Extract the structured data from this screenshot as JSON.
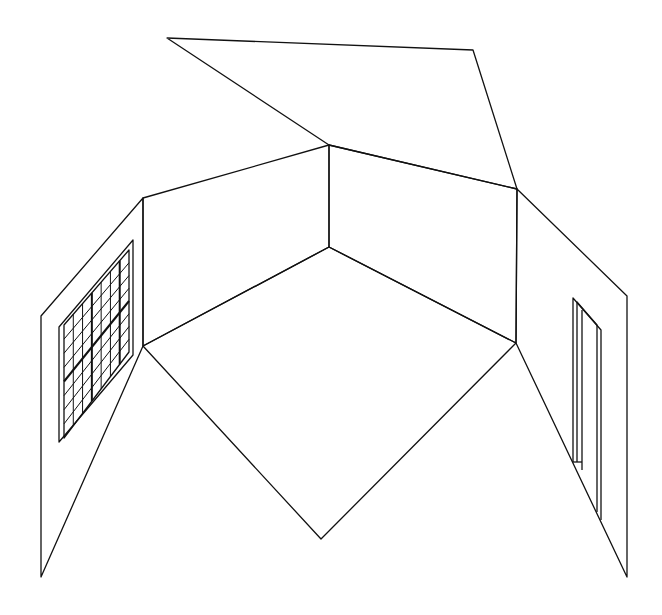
{
  "diagram": {
    "stroke_color": "#111111",
    "background": "#ffffff",
    "ceiling": [
      [
        167,
        38
      ],
      [
        473,
        50
      ],
      [
        517,
        189
      ],
      [
        329,
        145
      ]
    ],
    "back_wall_left": [
      [
        143,
        198
      ],
      [
        329,
        145
      ],
      [
        329,
        247
      ],
      [
        143,
        346
      ]
    ],
    "back_wall_right": [
      [
        329,
        145
      ],
      [
        517,
        189
      ],
      [
        516,
        343
      ],
      [
        329,
        247
      ]
    ],
    "floor": [
      [
        143,
        346
      ],
      [
        329,
        247
      ],
      [
        516,
        343
      ],
      [
        321,
        539
      ]
    ],
    "left_wall": [
      [
        41,
        316
      ],
      [
        143,
        198
      ],
      [
        143,
        346
      ],
      [
        41,
        577
      ]
    ],
    "right_wall": [
      [
        517,
        189
      ],
      [
        627,
        296
      ],
      [
        627,
        577
      ],
      [
        516,
        343
      ]
    ],
    "window": {
      "outer": [
        [
          59,
          327
        ],
        [
          133,
          240
        ],
        [
          133,
          355
        ],
        [
          59,
          442
        ]
      ],
      "inner": [
        [
          64,
          325
        ],
        [
          129,
          250
        ],
        [
          129,
          352
        ],
        [
          64,
          438
        ]
      ],
      "cols": 7,
      "rows": 8
    },
    "door": {
      "outer": [
        [
          573,
          298
        ],
        [
          601,
          330
        ],
        [
          601,
          520
        ],
        [
          573,
          462
        ]
      ],
      "inner_left_x": 582
    }
  }
}
